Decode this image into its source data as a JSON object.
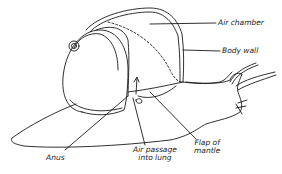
{
  "diagram": {
    "colors": {
      "ink": "#1a1a1a",
      "background": "#ffffff"
    },
    "labels": {
      "air_chamber": "Air chamber",
      "body_wall": "Body wall",
      "flap_of_mantle_line1": "Flap of",
      "flap_of_mantle_line2": "mantle",
      "anus": "Anus",
      "air_passage_line1": "Air passage",
      "air_passage_line2": "into lung"
    }
  }
}
